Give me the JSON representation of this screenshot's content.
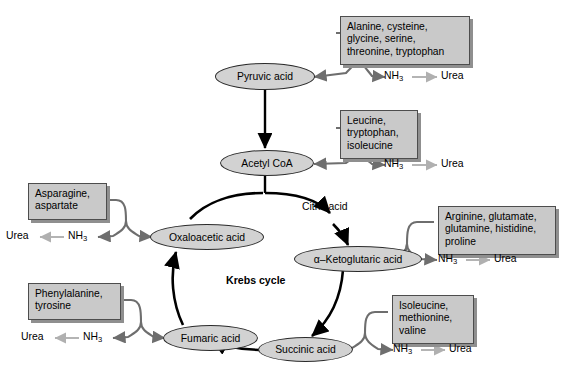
{
  "figure": {
    "title": "Krebs cycle",
    "center_label": "Krebs cycle",
    "caption_fragment": ""
  },
  "colors": {
    "box_fill": "#c9c9c9",
    "box_border": "#4d4d4d",
    "box_shadow": "#8f8f8f",
    "node_fill": "#d2d2d2",
    "node_border": "#2b2b2b",
    "cycle_arrow": "#000000",
    "connector_arrow": "#6e6e6e",
    "urea_arrow": "#b0b0b0",
    "background": "#ffffff"
  },
  "nodes": [
    {
      "id": "pyruvic",
      "label": "Pyruvic acid"
    },
    {
      "id": "acetyl",
      "label": "Acetyl CoA"
    },
    {
      "id": "oxaloacetic",
      "label": "Oxaloacetic acid"
    },
    {
      "id": "ketoglutaric",
      "label": "α–Ketoglutaric acid"
    },
    {
      "id": "fumaric",
      "label": "Fumaric acid"
    },
    {
      "id": "succinic",
      "label": "Succinic acid"
    }
  ],
  "cycle_labels": [
    {
      "id": "citric",
      "label": "Citric acid"
    }
  ],
  "boxes": [
    {
      "id": "box-pyruvic",
      "text": "Alanine, cysteine,\nglycine, serine,\nthreonine, tryptophan"
    },
    {
      "id": "box-acetyl",
      "text": "Leucine,\ntryptophan,\nisoleucine"
    },
    {
      "id": "box-ketoglutaric",
      "text": "Arginine, glutamate,\nglutamine, histidine,\nproline"
    },
    {
      "id": "box-succinic",
      "text": "Isoleucine,\nmethionine,\nvaline"
    },
    {
      "id": "box-fumaric",
      "text": "Phenylalanine,\ntyrosine"
    },
    {
      "id": "box-oxaloacetic",
      "text": "Asparagine,\naspartate"
    }
  ],
  "byproducts": {
    "ammonia": "NH",
    "ammonia_sub": "3",
    "urea": "Urea",
    "chains": [
      {
        "id": "chain-pyruvic",
        "ammonia": "NH",
        "sub": "3",
        "urea": "Urea",
        "direction": "right"
      },
      {
        "id": "chain-acetyl",
        "ammonia": "NH",
        "sub": "3",
        "urea": "Urea",
        "direction": "right"
      },
      {
        "id": "chain-ketoglutaric",
        "ammonia": "NH",
        "sub": "3",
        "urea": "Urea",
        "direction": "right"
      },
      {
        "id": "chain-succinic",
        "ammonia": "NH",
        "sub": "3",
        "urea": "Urea",
        "direction": "right"
      },
      {
        "id": "chain-fumaric",
        "ammonia": "NH",
        "sub": "3",
        "urea": "Urea",
        "direction": "left"
      },
      {
        "id": "chain-oxaloacetic",
        "ammonia": "NH",
        "sub": "3",
        "urea": "Urea",
        "direction": "left"
      }
    ]
  }
}
